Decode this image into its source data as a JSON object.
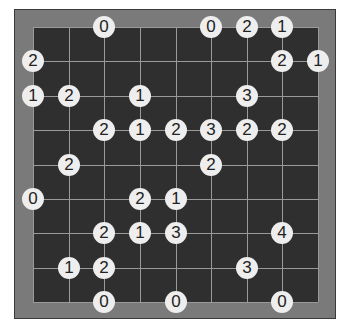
{
  "caption": "",
  "puzzle": {
    "type": "hashiwokakero",
    "cols": 9,
    "rows": 9,
    "colors": {
      "frame": "#7a7a7a",
      "board": "#2f2f2f",
      "grid": "#9a9a9a",
      "node": "#eeeeee",
      "text": "#222222"
    },
    "nodes": [
      {
        "c": 2,
        "r": 0,
        "v": "0"
      },
      {
        "c": 5,
        "r": 0,
        "v": "0"
      },
      {
        "c": 6,
        "r": 0,
        "v": "2"
      },
      {
        "c": 7,
        "r": 0,
        "v": "1"
      },
      {
        "c": 0,
        "r": 1,
        "v": "2"
      },
      {
        "c": 7,
        "r": 1,
        "v": "2"
      },
      {
        "c": 8,
        "r": 1,
        "v": "1"
      },
      {
        "c": 0,
        "r": 2,
        "v": "1"
      },
      {
        "c": 1,
        "r": 2,
        "v": "2"
      },
      {
        "c": 3,
        "r": 2,
        "v": "1"
      },
      {
        "c": 6,
        "r": 2,
        "v": "3"
      },
      {
        "c": 2,
        "r": 3,
        "v": "2"
      },
      {
        "c": 3,
        "r": 3,
        "v": "1"
      },
      {
        "c": 4,
        "r": 3,
        "v": "2"
      },
      {
        "c": 5,
        "r": 3,
        "v": "3"
      },
      {
        "c": 6,
        "r": 3,
        "v": "2"
      },
      {
        "c": 7,
        "r": 3,
        "v": "2"
      },
      {
        "c": 1,
        "r": 4,
        "v": "2"
      },
      {
        "c": 5,
        "r": 4,
        "v": "2"
      },
      {
        "c": 0,
        "r": 5,
        "v": "0"
      },
      {
        "c": 3,
        "r": 5,
        "v": "2"
      },
      {
        "c": 4,
        "r": 5,
        "v": "1"
      },
      {
        "c": 2,
        "r": 6,
        "v": "2"
      },
      {
        "c": 3,
        "r": 6,
        "v": "1"
      },
      {
        "c": 4,
        "r": 6,
        "v": "3"
      },
      {
        "c": 7,
        "r": 6,
        "v": "4"
      },
      {
        "c": 1,
        "r": 7,
        "v": "1"
      },
      {
        "c": 2,
        "r": 7,
        "v": "2"
      },
      {
        "c": 6,
        "r": 7,
        "v": "3"
      },
      {
        "c": 2,
        "r": 8,
        "v": "0"
      },
      {
        "c": 4,
        "r": 8,
        "v": "0"
      },
      {
        "c": 7,
        "r": 8,
        "v": "0"
      }
    ]
  }
}
